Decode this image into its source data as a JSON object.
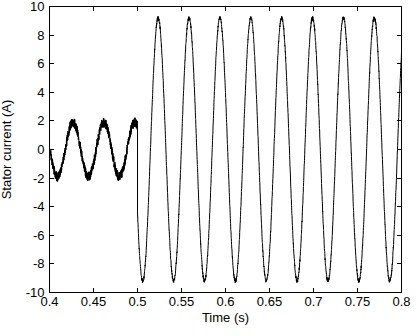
{
  "figure": {
    "background": "#ffffff",
    "width_px": 418,
    "height_px": 336
  },
  "chart_data": {
    "type": "line",
    "title": "",
    "xlabel": "Time (s)",
    "ylabel": "Stator current (A)",
    "xlim": [
      0.4,
      0.8
    ],
    "ylim": [
      -10,
      10
    ],
    "xtick_values": [
      0.4,
      0.45,
      0.5,
      0.55,
      0.6,
      0.65,
      0.7,
      0.75,
      0.8
    ],
    "xtick_labels": [
      "0.4",
      "0.45",
      "0.5",
      "0.55",
      "0.6",
      "0.65",
      "0.7",
      "0.75",
      "0.8"
    ],
    "ytick_values": [
      10,
      8,
      6,
      4,
      2,
      0,
      -2,
      -4,
      -6,
      -8,
      -10
    ],
    "ytick_labels": [
      "10",
      "8",
      "6",
      "4",
      "2",
      "0",
      "-2",
      "-4",
      "-6",
      "-8",
      "-10"
    ],
    "grid": false,
    "box": true,
    "legend_position": "none",
    "line_color": "#000000",
    "axis_color": "#000000",
    "background": "#ffffff",
    "series": [
      {
        "name": "stator current",
        "signal_model": "piecewise noisy sinusoid with amplitude step at t = 0.5 s",
        "sample_rate_hz": 8000,
        "segments": [
          {
            "t_start": 0.4,
            "t_end": 0.5,
            "amplitude": 1.9,
            "frequency_hz": 28.5,
            "phase_rad": 3.073,
            "noise_amplitude": 0.35
          },
          {
            "t_start": 0.5,
            "t_end": 0.8,
            "amplitude": 9.2,
            "frequency_hz": 28.5,
            "phase_rad": -2.637,
            "noise_amplitude": 0.13
          }
        ]
      }
    ]
  }
}
